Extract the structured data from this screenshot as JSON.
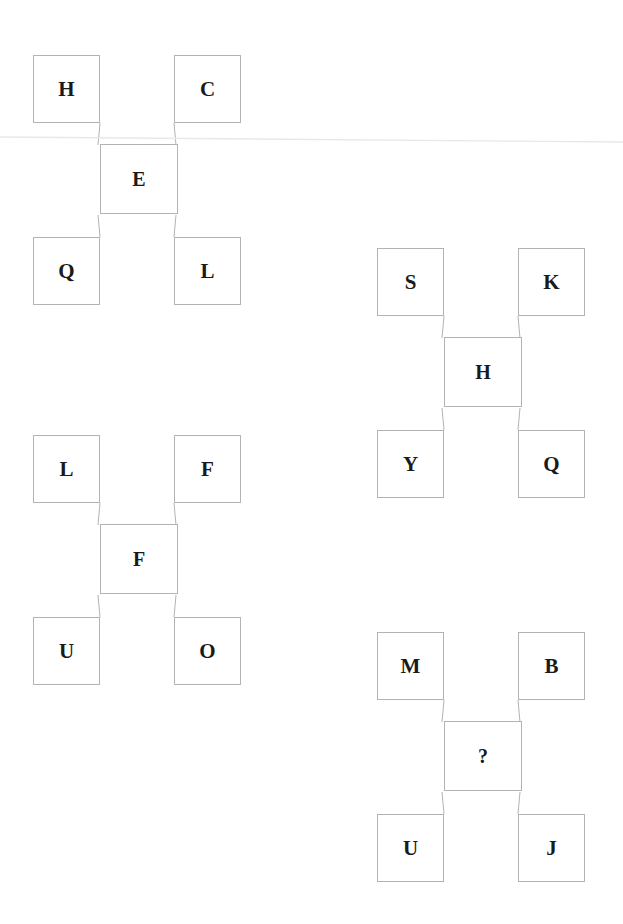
{
  "page": {
    "background_color": "#ffffff",
    "border_color": "#b3b3b3",
    "text_color": "#1a1a1a",
    "artifact": "faint-horizontal-scan-line"
  },
  "puzzle": {
    "type": "letter-analogy-grid",
    "missing_marker": "?",
    "groups": [
      {
        "id": "group-1",
        "position": {
          "left": 33,
          "top": 55
        },
        "cells": {
          "top_left": "H",
          "top_right": "C",
          "center": "E",
          "bottom_left": "Q",
          "bottom_right": "L"
        }
      },
      {
        "id": "group-2",
        "position": {
          "left": 377,
          "top": 248
        },
        "cells": {
          "top_left": "S",
          "top_right": "K",
          "center": "H",
          "bottom_left": "Y",
          "bottom_right": "Q"
        }
      },
      {
        "id": "group-3",
        "position": {
          "left": 33,
          "top": 435
        },
        "cells": {
          "top_left": "L",
          "top_right": "F",
          "center": "F",
          "bottom_left": "U",
          "bottom_right": "O"
        }
      },
      {
        "id": "group-4",
        "position": {
          "left": 377,
          "top": 632
        },
        "cells": {
          "top_left": "M",
          "top_right": "B",
          "center": "?",
          "bottom_left": "U",
          "bottom_right": "J"
        }
      }
    ]
  }
}
